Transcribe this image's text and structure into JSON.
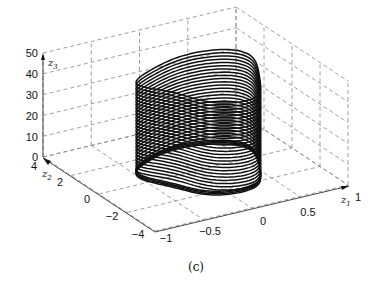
{
  "chart_data": {
    "type": "line3d",
    "title": "",
    "caption": "(c)",
    "axes": {
      "x": {
        "label": "z1",
        "ticks": [
          "-1",
          "-0.5",
          "0",
          "0.5",
          "1"
        ],
        "range": [
          -1,
          1
        ]
      },
      "y": {
        "label": "z2",
        "ticks": [
          "4",
          "2",
          "0",
          "-2",
          "-4"
        ],
        "range": [
          -4,
          4
        ]
      },
      "z": {
        "label": "z3",
        "ticks": [
          "0",
          "10",
          "20",
          "30",
          "40",
          "50"
        ],
        "range": [
          0,
          50
        ]
      }
    },
    "grid": true,
    "series": [
      {
        "name": "trajectory",
        "levels": 30,
        "z3_min": 0,
        "z3_max": 45
      }
    ]
  },
  "labels": {
    "z1": "z",
    "z1_sub": "1",
    "z2": "z",
    "z2_sub": "2",
    "z3": "z",
    "z3_sub": "3",
    "caption": "(c)",
    "z3_ticks": [
      "50",
      "40",
      "30",
      "20",
      "10",
      "0"
    ],
    "z2_ticks": [
      "4",
      "2",
      "0",
      "−2",
      "−4"
    ],
    "z1_ticks": [
      "−1",
      "−0.5",
      "0",
      "0.5",
      "1"
    ]
  }
}
